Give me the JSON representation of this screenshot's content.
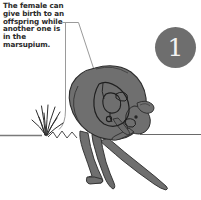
{
  "figure": {
    "kind": "marsupial-reproduction-illustration",
    "background_color": "#ffffff"
  },
  "caption": {
    "text": "The female can give birth to an offspring while another one is in the marsupium.",
    "lines": [
      "The female can",
      "give birth to",
      "an offspring",
      "while another",
      "one is in the",
      "marsupium."
    ],
    "color": "#2a2a2a"
  },
  "step_badge": {
    "number": "1",
    "fill_color": "#6e6e6e",
    "text_color": "#f2f2f2"
  },
  "illustration": {
    "animal_body_color": "#6f6f6f",
    "animal_shade_color": "#5e5e5e",
    "outline_color": "#2b2b2b",
    "grass_color": "#333333",
    "ground_line_color": "#6a6a6a",
    "leader_line_color": "#8a8a8a",
    "parts": [
      "body",
      "head",
      "ear",
      "forelimb",
      "hind-leg",
      "tail",
      "pouch",
      "joey-in-pouch",
      "teat",
      "newborn"
    ],
    "annotations": [
      "leader-line-vertical-to-ground",
      "leader-line-diagonal-to-pouch",
      "ground-line-left",
      "ground-line-right"
    ]
  }
}
